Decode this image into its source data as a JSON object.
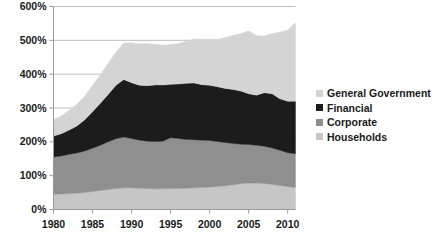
{
  "chart_data": {
    "type": "area",
    "stacked": true,
    "title": "",
    "xlabel": "",
    "ylabel": "",
    "grid": true,
    "legend_position": "right",
    "xlim": [
      1980,
      2011
    ],
    "ylim": [
      0,
      600
    ],
    "x": [
      1980,
      1981,
      1982,
      1983,
      1984,
      1985,
      1986,
      1987,
      1988,
      1989,
      1990,
      1991,
      1992,
      1993,
      1994,
      1995,
      1996,
      1997,
      1998,
      1999,
      2000,
      2001,
      2002,
      2003,
      2004,
      2005,
      2006,
      2007,
      2008,
      2009,
      2010,
      2011
    ],
    "xticks": [
      1980,
      1985,
      1990,
      1995,
      2000,
      2005,
      2010
    ],
    "xtick_labels": [
      "1980",
      "1985",
      "1990",
      "1995",
      "2000",
      "2005",
      "2010"
    ],
    "yticks": [
      0,
      100,
      200,
      300,
      400,
      500,
      600
    ],
    "ytick_labels": [
      "0%",
      "100%",
      "200%",
      "300%",
      "400%",
      "500%",
      "600%"
    ],
    "series": [
      {
        "name": "Households",
        "color": "#c6c6c6",
        "values": [
          45,
          46,
          47,
          48,
          50,
          53,
          56,
          59,
          62,
          64,
          64,
          63,
          62,
          61,
          61,
          62,
          62,
          63,
          64,
          65,
          66,
          68,
          70,
          73,
          76,
          78,
          78,
          77,
          74,
          71,
          68,
          65
        ]
      },
      {
        "name": "Corporate",
        "color": "#8f8f8f",
        "values": [
          110,
          112,
          116,
          119,
          123,
          128,
          134,
          141,
          147,
          150,
          146,
          142,
          140,
          140,
          141,
          150,
          148,
          144,
          142,
          140,
          138,
          133,
          128,
          122,
          117,
          114,
          112,
          110,
          108,
          104,
          100,
          100
        ]
      },
      {
        "name": "Financial",
        "color": "#1c1c1c",
        "values": [
          62,
          66,
          72,
          80,
          92,
          108,
          124,
          140,
          158,
          170,
          165,
          162,
          164,
          167,
          166,
          158,
          161,
          166,
          168,
          164,
          163,
          162,
          160,
          160,
          157,
          150,
          148,
          158,
          160,
          152,
          152,
          155
        ]
      },
      {
        "name": "General Government",
        "color": "#d4d4d4",
        "values": [
          48,
          52,
          58,
          64,
          70,
          78,
          84,
          92,
          98,
          108,
          118,
          122,
          124,
          120,
          118,
          118,
          120,
          124,
          130,
          134,
          136,
          140,
          150,
          160,
          170,
          186,
          176,
          168,
          178,
          198,
          210,
          232
        ]
      }
    ],
    "totals_note": "Stacked totals rise from about 265% in 1980 to about 552% in 2011"
  },
  "legend": {
    "items": [
      {
        "label": "General Government",
        "color": "#d4d4d4"
      },
      {
        "label": "Financial",
        "color": "#1c1c1c"
      },
      {
        "label": "Corporate",
        "color": "#8f8f8f"
      },
      {
        "label": "Households",
        "color": "#c6c6c6"
      }
    ]
  },
  "axes": {
    "grid_color": "#bfbfbf",
    "axis_color": "#9a9a9a"
  }
}
